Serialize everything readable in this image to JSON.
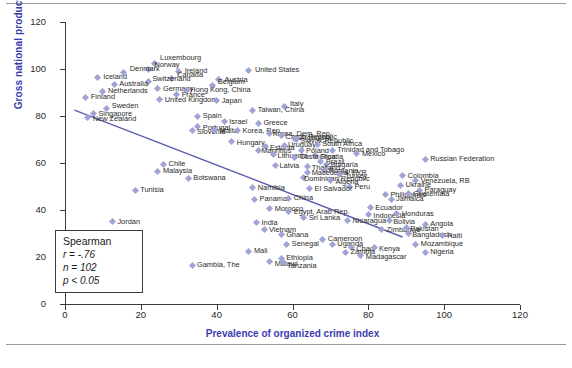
{
  "figure": {
    "top_rule": "horizontal-rule",
    "bottom_rule": "horizontal-rule"
  },
  "stats": {
    "title": "Spearman",
    "r_label": "r = -.76",
    "n_label": "n = 102",
    "p_label": "p < 0.05"
  },
  "colors": {
    "axis_title": "#3b3bb0",
    "marker": "#9fa3d6",
    "trendline": "#5a5fae",
    "axis": "#3b3b3b",
    "label_text": "#2a2a2a"
  },
  "chart_data": {
    "type": "scatter",
    "title": "",
    "xlabel": "Prevalence of organized crime index",
    "ylabel": "Gross national product per capita (rank)",
    "xlim": [
      0,
      120
    ],
    "ylim": [
      0,
      120
    ],
    "xticks": [
      0,
      20,
      40,
      60,
      80,
      100,
      120
    ],
    "yticks": [
      0,
      20,
      40,
      60,
      80,
      100,
      120
    ],
    "grid": false,
    "legend": "none",
    "annotations": [
      "Spearman",
      "r = -.76",
      "n = 102",
      "p < 0.05"
    ],
    "trendline": {
      "x0": 2.5,
      "y0": 82.5,
      "x1": 89,
      "y1": 28.5
    },
    "points": [
      {
        "label": "Luxembourg",
        "x": 23.5,
        "y": 102.5,
        "lx": 6,
        "ly": -9
      },
      {
        "label": "Norway",
        "x": 22.0,
        "y": 100.0,
        "lx": 6,
        "ly": -8
      },
      {
        "label": "Ireland",
        "x": 30.0,
        "y": 99.0,
        "lx": 6,
        "ly": -4
      },
      {
        "label": "United States",
        "x": 48.5,
        "y": 99.5,
        "lx": 6,
        "ly": -4
      },
      {
        "label": "Denmark",
        "x": 15.5,
        "y": 98.5,
        "lx": 6,
        "ly": -8
      },
      {
        "label": "Iceland",
        "x": 8.5,
        "y": 96.5,
        "lx": 6,
        "ly": -4
      },
      {
        "label": "Canada",
        "x": 28.0,
        "y": 96.0,
        "lx": 6,
        "ly": -7
      },
      {
        "label": "Austria",
        "x": 40.5,
        "y": 95.5,
        "lx": 6,
        "ly": -4
      },
      {
        "label": "Switzerland",
        "x": 22.0,
        "y": 94.5,
        "lx": 4,
        "ly": -7
      },
      {
        "label": "Australia",
        "x": 13.0,
        "y": 93.5,
        "lx": 5,
        "ly": -4
      },
      {
        "label": "Belgium",
        "x": 39.0,
        "y": 93.0,
        "lx": 5,
        "ly": -7
      },
      {
        "label": "Germany",
        "x": 24.5,
        "y": 91.5,
        "lx": 5,
        "ly": -4
      },
      {
        "label": "Hong Kong, China",
        "x": 32.0,
        "y": 91.0,
        "lx": 4,
        "ly": -4
      },
      {
        "label": "Netherlands",
        "x": 10.0,
        "y": 90.5,
        "lx": 5,
        "ly": -4
      },
      {
        "label": "France",
        "x": 29.5,
        "y": 89.0,
        "lx": 5,
        "ly": -4
      },
      {
        "label": "Finland",
        "x": 5.5,
        "y": 88.0,
        "lx": 5,
        "ly": -4
      },
      {
        "label": "United Kingdom",
        "x": 25.0,
        "y": 87.0,
        "lx": 5,
        "ly": -4
      },
      {
        "label": "Japan",
        "x": 40.0,
        "y": 86.5,
        "lx": 5,
        "ly": -4
      },
      {
        "label": "Italy",
        "x": 58.0,
        "y": 84.0,
        "lx": 5,
        "ly": -7
      },
      {
        "label": "Sweden",
        "x": 11.0,
        "y": 83.0,
        "lx": 5,
        "ly": -7
      },
      {
        "label": "Taiwan, China",
        "x": 49.5,
        "y": 82.5,
        "lx": 5,
        "ly": -4
      },
      {
        "label": "Singapore",
        "x": 7.5,
        "y": 81.0,
        "lx": 5,
        "ly": -4
      },
      {
        "label": "New Zealand",
        "x": 6.0,
        "y": 79.5,
        "lx": 5,
        "ly": -2
      },
      {
        "label": "Spain",
        "x": 35.0,
        "y": 80.0,
        "lx": 5,
        "ly": -4
      },
      {
        "label": "Israel",
        "x": 42.0,
        "y": 77.5,
        "lx": 5,
        "ly": -4
      },
      {
        "label": "Greece",
        "x": 51.0,
        "y": 77.0,
        "lx": 5,
        "ly": -4
      },
      {
        "label": "Portugal",
        "x": 35.0,
        "y": 75.5,
        "lx": 5,
        "ly": -3
      },
      {
        "label": "Slovenia",
        "x": 33.5,
        "y": 74.0,
        "lx": 5,
        "ly": -2
      },
      {
        "label": "Malta",
        "x": 39.5,
        "y": 74.0,
        "lx": 5,
        "ly": -3
      },
      {
        "label": "Korea, Rep.",
        "x": 45.5,
        "y": 74.0,
        "lx": 5,
        "ly": -3
      },
      {
        "label": "Korea, Dem. Rep.",
        "x": 54.0,
        "y": 72.5,
        "lx": 3,
        "ly": -4
      },
      {
        "label": "Czech Republic",
        "x": 57.0,
        "y": 71.5,
        "lx": 4,
        "ly": -3
      },
      {
        "label": "Slovak Republic",
        "x": 61.0,
        "y": 70.0,
        "lx": 4,
        "ly": -3
      },
      {
        "label": "Hungary",
        "x": 44.0,
        "y": 69.0,
        "lx": 5,
        "ly": -3
      },
      {
        "label": "Estonia",
        "x": 53.0,
        "y": 67.0,
        "lx": 4,
        "ly": -3
      },
      {
        "label": "Uruguay",
        "x": 58.0,
        "y": 67.5,
        "lx": 3,
        "ly": -4
      },
      {
        "label": "Mauritius",
        "x": 51.0,
        "y": 65.5,
        "lx": 3,
        "ly": -3
      },
      {
        "label": "Poland",
        "x": 62.5,
        "y": 65.5,
        "lx": 4,
        "ly": -3
      },
      {
        "label": "Lithuania",
        "x": 55.0,
        "y": 63.5,
        "lx": 4,
        "ly": -3
      },
      {
        "label": "Croatia",
        "x": 66.0,
        "y": 63.0,
        "lx": 4,
        "ly": -3
      },
      {
        "label": "Argentina",
        "x": 60.5,
        "y": 70.5,
        "lx": 5,
        "ly": -4
      },
      {
        "label": "South Africa",
        "x": 66.5,
        "y": 68.0,
        "lx": 5,
        "ly": -4
      },
      {
        "label": "Trinidad and Tobago",
        "x": 70.5,
        "y": 65.5,
        "lx": 5,
        "ly": -4
      },
      {
        "label": "Mexico",
        "x": 77.0,
        "y": 64.0,
        "lx": 5,
        "ly": -4
      },
      {
        "label": "Costa Rica",
        "x": 60.5,
        "y": 62.5,
        "lx": 5,
        "ly": -4
      },
      {
        "label": "Russian Federation",
        "x": 95.0,
        "y": 61.5,
        "lx": 5,
        "ly": -4
      },
      {
        "label": "Brazil",
        "x": 67.5,
        "y": 60.5,
        "lx": 5,
        "ly": -4
      },
      {
        "label": "Bulgaria",
        "x": 69.0,
        "y": 59.5,
        "lx": 4,
        "ly": -3
      },
      {
        "label": "Thailand",
        "x": 64.0,
        "y": 58.5,
        "lx": 4,
        "ly": -3
      },
      {
        "label": "Chile",
        "x": 26.0,
        "y": 59.5,
        "lx": 5,
        "ly": -4
      },
      {
        "label": "Latvia",
        "x": 55.5,
        "y": 59.0,
        "lx": 4,
        "ly": -3
      },
      {
        "label": "Romania",
        "x": 68.5,
        "y": 57.0,
        "lx": 4,
        "ly": -3
      },
      {
        "label": "Malaysia",
        "x": 24.5,
        "y": 56.5,
        "lx": 5,
        "ly": -4
      },
      {
        "label": "Macedonia, FYR",
        "x": 64.0,
        "y": 56.0,
        "lx": 4,
        "ly": -3
      },
      {
        "label": "Turkey",
        "x": 72.5,
        "y": 55.0,
        "lx": 5,
        "ly": -3
      },
      {
        "label": "Botswana",
        "x": 32.5,
        "y": 53.5,
        "lx": 5,
        "ly": -4
      },
      {
        "label": "Dominican Republic",
        "x": 63.0,
        "y": 54.0,
        "lx": 0,
        "ly": -2
      },
      {
        "label": "Colombia",
        "x": 89.0,
        "y": 54.5,
        "lx": 5,
        "ly": -4
      },
      {
        "label": "Algeria",
        "x": 70.0,
        "y": 52.5,
        "lx": 5,
        "ly": -3
      },
      {
        "label": "Venezuela, RB",
        "x": 92.5,
        "y": 52.5,
        "lx": 5,
        "ly": -4
      },
      {
        "label": "Namibia",
        "x": 49.5,
        "y": 49.5,
        "lx": 5,
        "ly": -4
      },
      {
        "label": "Peru",
        "x": 75.0,
        "y": 50.0,
        "lx": 5,
        "ly": -4
      },
      {
        "label": "Ukraine",
        "x": 88.5,
        "y": 50.5,
        "lx": 5,
        "ly": -4
      },
      {
        "label": "Tunisia",
        "x": 18.5,
        "y": 48.5,
        "lx": 5,
        "ly": -4
      },
      {
        "label": "El Salvador",
        "x": 64.5,
        "y": 49.0,
        "lx": 5,
        "ly": -4
      },
      {
        "label": "Paraguay",
        "x": 93.5,
        "y": 48.5,
        "lx": 5,
        "ly": -4
      },
      {
        "label": "Panama",
        "x": 50.0,
        "y": 44.5,
        "lx": 5,
        "ly": -4
      },
      {
        "label": "China",
        "x": 59.0,
        "y": 45.0,
        "lx": 5,
        "ly": -4
      },
      {
        "label": "Philippines",
        "x": 84.5,
        "y": 46.5,
        "lx": 5,
        "ly": -4
      },
      {
        "label": "Guatemala",
        "x": 90.5,
        "y": 47.0,
        "lx": 5,
        "ly": -4
      },
      {
        "label": "Jamaica",
        "x": 86.0,
        "y": 44.5,
        "lx": 5,
        "ly": -4
      },
      {
        "label": "Morocco",
        "x": 54.0,
        "y": 40.5,
        "lx": 5,
        "ly": -4
      },
      {
        "label": "Egypt, Arab Rep.",
        "x": 59.0,
        "y": 39.5,
        "lx": 5,
        "ly": -3
      },
      {
        "label": "Ecuador",
        "x": 80.5,
        "y": 41.0,
        "lx": 5,
        "ly": -4
      },
      {
        "label": "Jordan",
        "x": 12.5,
        "y": 35.0,
        "lx": 5,
        "ly": -4
      },
      {
        "label": "Sri Lanka",
        "x": 63.0,
        "y": 37.0,
        "lx": 5,
        "ly": -3
      },
      {
        "label": "Indonesia",
        "x": 80.0,
        "y": 38.0,
        "lx": 5,
        "ly": -3
      },
      {
        "label": "Honduras",
        "x": 87.5,
        "y": 38.5,
        "lx": 5,
        "ly": -4
      },
      {
        "label": "India",
        "x": 50.5,
        "y": 34.5,
        "lx": 5,
        "ly": -4
      },
      {
        "label": "Nicaragua",
        "x": 74.5,
        "y": 35.5,
        "lx": 5,
        "ly": -4
      },
      {
        "label": "Bolivia",
        "x": 85.5,
        "y": 35.5,
        "lx": 4,
        "ly": -3
      },
      {
        "label": "Vietnam",
        "x": 52.5,
        "y": 31.5,
        "lx": 5,
        "ly": -4
      },
      {
        "label": "Angola",
        "x": 95.0,
        "y": 34.0,
        "lx": 5,
        "ly": -4
      },
      {
        "label": "Zimbabwe",
        "x": 83.5,
        "y": 31.5,
        "lx": 5,
        "ly": -4
      },
      {
        "label": "Pakistan",
        "x": 90.0,
        "y": 32.5,
        "lx": 4,
        "ly": -3
      },
      {
        "label": "Ghana",
        "x": 57.0,
        "y": 29.5,
        "lx": 5,
        "ly": -4
      },
      {
        "label": "Bangladesh",
        "x": 90.5,
        "y": 30.0,
        "lx": 4,
        "ly": -3
      },
      {
        "label": "Cameroon",
        "x": 68.0,
        "y": 27.5,
        "lx": 5,
        "ly": -4
      },
      {
        "label": "Haiti",
        "x": 99.5,
        "y": 29.0,
        "lx": 5,
        "ly": -4
      },
      {
        "label": "Senegal",
        "x": 58.5,
        "y": 25.5,
        "lx": 5,
        "ly": -4
      },
      {
        "label": "Uganda",
        "x": 70.5,
        "y": 25.5,
        "lx": 5,
        "ly": -4
      },
      {
        "label": "Mozambique",
        "x": 92.5,
        "y": 25.5,
        "lx": 5,
        "ly": -4
      },
      {
        "label": "Chad",
        "x": 75.5,
        "y": 24.0,
        "lx": 5,
        "ly": -3
      },
      {
        "label": "Kenya",
        "x": 81.5,
        "y": 24.0,
        "lx": 5,
        "ly": -3
      },
      {
        "label": "Mali",
        "x": 48.5,
        "y": 22.5,
        "lx": 5,
        "ly": -4
      },
      {
        "label": "Zambia",
        "x": 74.0,
        "y": 22.0,
        "lx": 5,
        "ly": -4
      },
      {
        "label": "Nigeria",
        "x": 95.0,
        "y": 22.0,
        "lx": 5,
        "ly": -4
      },
      {
        "label": "Gambia, The",
        "x": 33.5,
        "y": 16.5,
        "lx": 5,
        "ly": -4
      },
      {
        "label": "Madagascar",
        "x": 78.0,
        "y": 20.5,
        "lx": 5,
        "ly": -3
      },
      {
        "label": "Ethiopia",
        "x": 57.0,
        "y": 19.5,
        "lx": 5,
        "ly": -4
      },
      {
        "label": "Malawi",
        "x": 54.0,
        "y": 18.0,
        "lx": 5,
        "ly": -2
      },
      {
        "label": "Tanzania",
        "x": 57.5,
        "y": 17.5,
        "lx": 4,
        "ly": -1
      }
    ]
  }
}
